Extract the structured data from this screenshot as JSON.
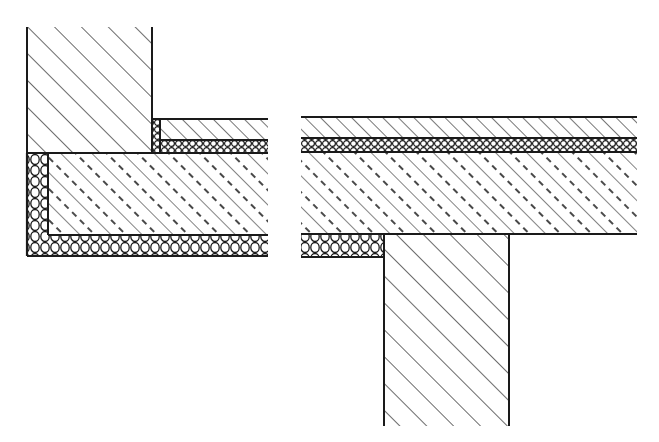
{
  "figure": {
    "colors": {
      "line": "#1a1a1a",
      "background": "#ffffff"
    },
    "panels": [
      {
        "id": "corner-detail",
        "label": "Exterior wall corner with floor slab",
        "layers": [
          {
            "name": "masonry-wall",
            "hatch": "diagonal",
            "x": 27,
            "y": 27,
            "w": 125,
            "h": 126
          },
          {
            "name": "edge-insulation-strip",
            "hatch": "insulation-fine",
            "x": 152,
            "y": 119,
            "w": 8,
            "h": 34
          },
          {
            "name": "screed",
            "hatch": "diagonal",
            "x": 160,
            "y": 119,
            "w": 108,
            "h": 21
          },
          {
            "name": "impact-insulation",
            "hatch": "insulation-fine",
            "x": 160,
            "y": 140,
            "w": 108,
            "h": 13
          },
          {
            "name": "concrete-slab",
            "hatch": "concrete",
            "x": 48,
            "y": 153,
            "w": 220,
            "h": 82
          },
          {
            "name": "perimeter-insulation",
            "hatch": "insulation",
            "x": 27,
            "y": 153,
            "w": 21,
            "h": 103
          },
          {
            "name": "bottom-insulation",
            "hatch": "insulation",
            "x": 27,
            "y": 235,
            "w": 241,
            "h": 21
          }
        ]
      },
      {
        "id": "column-detail",
        "label": "Floor slab over supporting wall",
        "layers": [
          {
            "name": "screed",
            "hatch": "diagonal",
            "x": 301,
            "y": 117,
            "w": 336,
            "h": 21
          },
          {
            "name": "impact-insulation",
            "hatch": "insulation-fine",
            "x": 301,
            "y": 138,
            "w": 336,
            "h": 14
          },
          {
            "name": "concrete-slab",
            "hatch": "concrete",
            "x": 301,
            "y": 152,
            "w": 336,
            "h": 82
          },
          {
            "name": "bottom-insulation",
            "hatch": "insulation",
            "x": 301,
            "y": 234,
            "w": 83,
            "h": 23
          },
          {
            "name": "supporting-wall",
            "hatch": "diagonal",
            "x": 384,
            "y": 234,
            "w": 125,
            "h": 192
          }
        ]
      }
    ]
  }
}
